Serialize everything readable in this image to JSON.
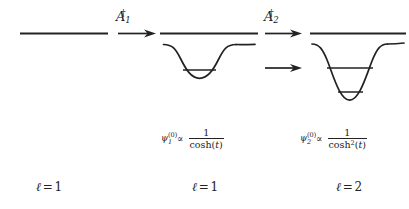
{
  "figure": {
    "background_color": "#ffffff",
    "stroke_color": "#222222",
    "panels": [
      {
        "id": "panel-1",
        "ell_label": {
          "symbol": "ℓ",
          "equals": "=",
          "value": "1"
        },
        "has_well": false,
        "continuum_line": true,
        "wavefunction_label": null
      },
      {
        "id": "panel-2",
        "ell_label": {
          "symbol": "ℓ",
          "equals": "=",
          "value": "1"
        },
        "has_well": true,
        "continuum_line": true,
        "bound_states": 1,
        "wavefunction_label": {
          "psi": "ψ",
          "sub": "1",
          "sup": "(0)",
          "prop": "∝",
          "numerator": "1",
          "denominator_fn": "cosh",
          "denominator_pow": "",
          "denominator_var": "t"
        }
      },
      {
        "id": "panel-3",
        "ell_label": {
          "symbol": "ℓ",
          "equals": "=",
          "value": "2"
        },
        "has_well": true,
        "continuum_line": true,
        "bound_states": 2,
        "wavefunction_label": {
          "psi": "ψ",
          "sub": "2",
          "sup": "(0)",
          "prop": "∝",
          "numerator": "1",
          "denominator_fn": "cosh",
          "denominator_pow": "2",
          "denominator_var": "t"
        }
      }
    ],
    "operators": [
      {
        "id": "operator-1",
        "letter": "A",
        "sub": "1",
        "dagger": "†",
        "arrow_count": 1
      },
      {
        "id": "operator-2",
        "letter": "A",
        "sub": "2",
        "dagger": "†",
        "arrow_count": 2
      }
    ]
  }
}
